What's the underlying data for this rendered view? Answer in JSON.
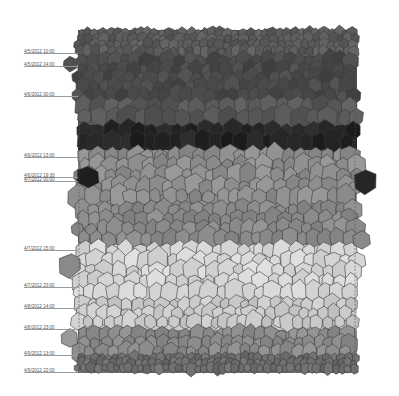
{
  "diagram": {
    "type": "voronoi-time-series",
    "plot_area": {
      "x0": 78,
      "x1": 357,
      "y0": 30,
      "y1": 373
    },
    "dashed_guides_x": [
      79,
      355
    ],
    "time_labels": [
      {
        "label": "4/5/2012 10:00",
        "y": 53
      },
      {
        "label": "4/5/2012 14:00",
        "y": 66
      },
      {
        "label": "4/6/2012 00:00",
        "y": 96
      },
      {
        "label": "4/6/2012 13:00",
        "y": 157
      },
      {
        "label": "4/6/2012 19:30",
        "y": 177
      },
      {
        "label": "4/7/2012 00:00",
        "y": 181
      },
      {
        "label": "4/7/2012 15:00",
        "y": 250
      },
      {
        "label": "4/7/2012 23:00",
        "y": 287
      },
      {
        "label": "4/8/2012 14:00",
        "y": 308
      },
      {
        "label": "4/8/2012 23:00",
        "y": 329
      },
      {
        "label": "4/9/2012 13:00",
        "y": 355
      },
      {
        "label": "4/9/2012 22:00",
        "y": 372
      }
    ],
    "bands": [
      {
        "y0": 30,
        "y1": 56,
        "color": "#5c5c5c",
        "cell": 7
      },
      {
        "y0": 56,
        "y1": 100,
        "color": "#4a4a4a",
        "cell": 10
      },
      {
        "y0": 100,
        "y1": 125,
        "color": "#585858",
        "cell": 13
      },
      {
        "y0": 125,
        "y1": 150,
        "color": "#242424",
        "cell": 12
      },
      {
        "y0": 150,
        "y1": 205,
        "color": "#8e8e8e",
        "cell": 12
      },
      {
        "y0": 205,
        "y1": 245,
        "color": "#8a8a8a",
        "cell": 11
      },
      {
        "y0": 245,
        "y1": 300,
        "color": "#d6d6d6",
        "cell": 12
      },
      {
        "y0": 300,
        "y1": 330,
        "color": "#cacaca",
        "cell": 10
      },
      {
        "y0": 330,
        "y1": 355,
        "color": "#8c8c8c",
        "cell": 10
      },
      {
        "y0": 355,
        "y1": 373,
        "color": "#6e6e6e",
        "cell": 6
      }
    ],
    "outliers": [
      {
        "x": 70,
        "y": 64,
        "r": 8,
        "color": "#505050"
      },
      {
        "x": 88,
        "y": 177,
        "r": 12,
        "color": "#1e1e1e"
      },
      {
        "x": 365,
        "y": 182,
        "r": 13,
        "color": "#262626"
      },
      {
        "x": 70,
        "y": 265,
        "r": 13,
        "color": "#8a8a8a"
      },
      {
        "x": 362,
        "y": 240,
        "r": 10,
        "color": "#8a8a8a"
      },
      {
        "x": 69,
        "y": 338,
        "r": 10,
        "color": "#9a9a9a"
      }
    ],
    "edge_color": "#3a3a3a",
    "guide_color": "#555555"
  }
}
